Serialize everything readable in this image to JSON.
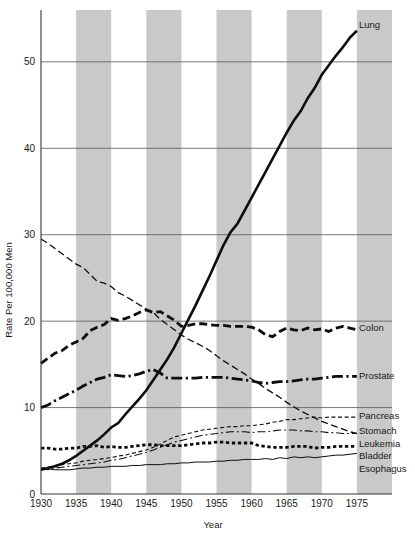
{
  "chart_data": {
    "type": "line",
    "title": "",
    "xlabel": "Year",
    "ylabel": "Rate Per 100,000 Men",
    "xlim": [
      1930,
      1980
    ],
    "ylim": [
      0,
      56
    ],
    "grid": "horizontal-major",
    "legend_position": "right-inline-labels",
    "xticks": [
      1930,
      1935,
      1940,
      1945,
      1950,
      1955,
      1960,
      1965,
      1970,
      1975
    ],
    "xtick_labels": [
      "1930",
      "1935",
      "1940",
      "1945",
      "1950",
      "1955",
      "1960",
      "1965",
      "1970",
      "1975"
    ],
    "yticks": [
      0,
      10,
      20,
      30,
      40,
      50
    ],
    "ytick_labels": [
      "0",
      "10",
      "20",
      "30",
      "40",
      "50"
    ],
    "shaded_bands": [
      {
        "from": 1935,
        "to": 1940
      },
      {
        "from": 1945,
        "to": 1950
      },
      {
        "from": 1955,
        "to": 1960
      },
      {
        "from": 1965,
        "to": 1970
      },
      {
        "from": 1975,
        "to": 1980
      }
    ],
    "band_color": "#c9c9c9",
    "series": [
      {
        "name": "Lung",
        "label": "Lung",
        "style": "solid-thick",
        "x": [
          1930,
          1931,
          1932,
          1933,
          1934,
          1935,
          1936,
          1937,
          1938,
          1939,
          1940,
          1941,
          1942,
          1943,
          1944,
          1945,
          1946,
          1947,
          1948,
          1949,
          1950,
          1951,
          1952,
          1953,
          1954,
          1955,
          1956,
          1957,
          1958,
          1959,
          1960,
          1961,
          1962,
          1963,
          1964,
          1965,
          1966,
          1967,
          1968,
          1969,
          1970,
          1971,
          1972,
          1973,
          1974,
          1975
        ],
        "values": [
          2.8,
          3.0,
          3.2,
          3.5,
          3.9,
          4.4,
          5.0,
          5.6,
          6.2,
          6.9,
          7.7,
          8.2,
          9.2,
          10.1,
          11.0,
          12.0,
          13.2,
          14.4,
          15.6,
          17.0,
          18.6,
          20.2,
          21.8,
          23.5,
          25.2,
          27.0,
          28.8,
          30.3,
          31.3,
          32.8,
          34.3,
          35.8,
          37.3,
          38.8,
          40.3,
          41.8,
          43.2,
          44.3,
          45.8,
          47.0,
          48.5,
          49.6,
          50.7,
          51.7,
          52.8,
          53.6
        ]
      },
      {
        "name": "Colon",
        "label": "Colon",
        "style": "dashed-thick",
        "x": [
          1930,
          1931,
          1932,
          1933,
          1934,
          1935,
          1936,
          1937,
          1938,
          1939,
          1940,
          1941,
          1942,
          1943,
          1944,
          1945,
          1946,
          1947,
          1948,
          1949,
          1950,
          1951,
          1952,
          1953,
          1954,
          1955,
          1956,
          1957,
          1958,
          1959,
          1960,
          1961,
          1962,
          1963,
          1964,
          1965,
          1966,
          1967,
          1968,
          1969,
          1970,
          1971,
          1972,
          1973,
          1974,
          1975
        ],
        "values": [
          15.1,
          15.7,
          16.3,
          16.6,
          17.2,
          17.6,
          18.0,
          18.9,
          19.3,
          19.6,
          20.3,
          20.1,
          20.3,
          20.6,
          21.0,
          21.3,
          21.0,
          21.1,
          20.6,
          20.1,
          19.4,
          19.5,
          19.7,
          19.7,
          19.6,
          19.5,
          19.5,
          19.4,
          19.4,
          19.4,
          19.3,
          19.0,
          18.4,
          18.2,
          18.8,
          19.2,
          19.0,
          18.9,
          19.2,
          19.0,
          19.1,
          18.8,
          19.2,
          19.4,
          19.2,
          19.0
        ]
      },
      {
        "name": "Stomach",
        "label": "Stomach",
        "style": "dashed-thin",
        "x": [
          1930,
          1931,
          1932,
          1933,
          1934,
          1935,
          1936,
          1937,
          1938,
          1939,
          1940,
          1941,
          1942,
          1943,
          1944,
          1945,
          1946,
          1947,
          1948,
          1949,
          1950,
          1951,
          1952,
          1953,
          1954,
          1955,
          1956,
          1957,
          1958,
          1959,
          1960,
          1961,
          1962,
          1963,
          1964,
          1965,
          1966,
          1967,
          1968,
          1969,
          1970,
          1971,
          1972,
          1973,
          1974,
          1975
        ],
        "values": [
          29.5,
          29.0,
          28.4,
          27.8,
          27.2,
          26.6,
          26.2,
          25.4,
          24.6,
          24.4,
          24.0,
          23.3,
          22.9,
          22.4,
          21.9,
          21.4,
          21.0,
          20.2,
          19.6,
          19.0,
          18.4,
          17.9,
          17.5,
          17.1,
          16.6,
          16.0,
          15.4,
          14.9,
          14.4,
          13.9,
          13.3,
          12.8,
          12.2,
          11.7,
          11.2,
          10.6,
          10.1,
          9.6,
          9.2,
          8.8,
          8.4,
          8.1,
          7.8,
          7.5,
          7.2,
          7.0
        ]
      },
      {
        "name": "Prostate",
        "label": "Prostate",
        "style": "dashdot-thick",
        "x": [
          1930,
          1931,
          1932,
          1933,
          1934,
          1935,
          1936,
          1937,
          1938,
          1939,
          1940,
          1941,
          1942,
          1943,
          1944,
          1945,
          1946,
          1947,
          1948,
          1949,
          1950,
          1951,
          1952,
          1953,
          1954,
          1955,
          1956,
          1957,
          1958,
          1959,
          1960,
          1961,
          1962,
          1963,
          1964,
          1965,
          1966,
          1967,
          1968,
          1969,
          1970,
          1971,
          1972,
          1973,
          1974,
          1975
        ],
        "values": [
          10.0,
          10.3,
          10.8,
          11.2,
          11.6,
          12.0,
          12.5,
          12.9,
          13.3,
          13.5,
          13.8,
          13.7,
          13.6,
          13.7,
          13.9,
          14.2,
          14.4,
          14.0,
          13.4,
          13.4,
          13.4,
          13.4,
          13.4,
          13.5,
          13.5,
          13.5,
          13.5,
          13.4,
          13.3,
          13.2,
          13.1,
          12.9,
          12.8,
          12.9,
          13.0,
          13.0,
          13.1,
          13.2,
          13.3,
          13.3,
          13.4,
          13.5,
          13.6,
          13.6,
          13.6,
          13.6
        ]
      },
      {
        "name": "Pancreas",
        "label": "Pancreas",
        "style": "dashed-fine",
        "x": [
          1930,
          1931,
          1932,
          1933,
          1934,
          1935,
          1936,
          1937,
          1938,
          1939,
          1940,
          1941,
          1942,
          1943,
          1944,
          1945,
          1946,
          1947,
          1948,
          1949,
          1950,
          1951,
          1952,
          1953,
          1954,
          1955,
          1956,
          1957,
          1958,
          1959,
          1960,
          1961,
          1962,
          1963,
          1964,
          1965,
          1966,
          1967,
          1968,
          1969,
          1970,
          1971,
          1972,
          1973,
          1974,
          1975
        ],
        "values": [
          3.0,
          3.1,
          3.3,
          3.4,
          3.5,
          3.6,
          3.8,
          3.9,
          4.0,
          4.1,
          4.2,
          4.4,
          4.5,
          4.7,
          4.9,
          5.1,
          5.4,
          5.8,
          6.2,
          6.6,
          6.8,
          7.0,
          7.2,
          7.4,
          7.5,
          7.6,
          7.7,
          7.8,
          7.8,
          7.9,
          7.9,
          8.0,
          8.1,
          8.3,
          8.4,
          8.6,
          8.6,
          8.7,
          8.8,
          8.9,
          8.8,
          8.9,
          8.9,
          8.9,
          8.9,
          8.9
        ]
      },
      {
        "name": "Leukemia",
        "label": "Leukemia",
        "style": "dashdot-thin",
        "x": [
          1930,
          1931,
          1932,
          1933,
          1934,
          1935,
          1936,
          1937,
          1938,
          1939,
          1940,
          1941,
          1942,
          1943,
          1944,
          1945,
          1946,
          1947,
          1948,
          1949,
          1950,
          1951,
          1952,
          1953,
          1954,
          1955,
          1956,
          1957,
          1958,
          1959,
          1960,
          1961,
          1962,
          1963,
          1964,
          1965,
          1966,
          1967,
          1968,
          1969,
          1970,
          1971,
          1972,
          1973,
          1974,
          1975
        ],
        "values": [
          2.9,
          2.8,
          3.0,
          3.1,
          3.2,
          3.3,
          3.4,
          3.5,
          3.6,
          3.7,
          3.9,
          4.0,
          4.2,
          4.4,
          4.6,
          4.8,
          5.1,
          5.4,
          5.7,
          6.0,
          6.2,
          6.4,
          6.6,
          6.8,
          6.9,
          7.0,
          7.1,
          7.2,
          7.2,
          7.2,
          7.1,
          7.2,
          7.2,
          7.3,
          7.4,
          7.4,
          7.4,
          7.3,
          7.3,
          7.2,
          7.2,
          7.1,
          7.1,
          7.0,
          7.0,
          7.0
        ]
      },
      {
        "name": "Bladder",
        "label": "Bladder",
        "style": "dotted-thick",
        "x": [
          1930,
          1931,
          1932,
          1933,
          1934,
          1935,
          1936,
          1937,
          1938,
          1939,
          1940,
          1941,
          1942,
          1943,
          1944,
          1945,
          1946,
          1947,
          1948,
          1949,
          1950,
          1951,
          1952,
          1953,
          1954,
          1955,
          1956,
          1957,
          1958,
          1959,
          1960,
          1961,
          1962,
          1963,
          1964,
          1965,
          1966,
          1967,
          1968,
          1969,
          1970,
          1971,
          1972,
          1973,
          1974,
          1975
        ],
        "values": [
          5.3,
          5.3,
          5.2,
          5.2,
          5.3,
          5.3,
          5.5,
          5.5,
          5.6,
          5.4,
          5.5,
          5.4,
          5.4,
          5.5,
          5.6,
          5.7,
          5.7,
          5.6,
          5.6,
          5.6,
          5.6,
          5.7,
          5.8,
          5.9,
          5.9,
          6.0,
          6.0,
          5.9,
          5.9,
          5.9,
          5.9,
          5.6,
          5.5,
          5.4,
          5.4,
          5.4,
          5.5,
          5.5,
          5.5,
          5.3,
          5.4,
          5.4,
          5.5,
          5.5,
          5.5,
          5.5
        ]
      },
      {
        "name": "Esophagus",
        "label": "Esophagus",
        "style": "solid-thin",
        "x": [
          1930,
          1931,
          1932,
          1933,
          1934,
          1935,
          1936,
          1937,
          1938,
          1939,
          1940,
          1941,
          1942,
          1943,
          1944,
          1945,
          1946,
          1947,
          1948,
          1949,
          1950,
          1951,
          1952,
          1953,
          1954,
          1955,
          1956,
          1957,
          1958,
          1959,
          1960,
          1961,
          1962,
          1963,
          1964,
          1965,
          1966,
          1967,
          1968,
          1969,
          1970,
          1971,
          1972,
          1973,
          1974,
          1975
        ],
        "values": [
          2.9,
          2.9,
          2.8,
          2.8,
          2.8,
          2.9,
          3.0,
          3.0,
          3.1,
          3.1,
          3.2,
          3.2,
          3.2,
          3.3,
          3.3,
          3.4,
          3.4,
          3.4,
          3.5,
          3.5,
          3.6,
          3.6,
          3.7,
          3.7,
          3.7,
          3.8,
          3.8,
          3.9,
          3.9,
          4.0,
          4.0,
          4.0,
          4.1,
          4.0,
          4.2,
          4.1,
          4.3,
          4.2,
          4.3,
          4.2,
          4.3,
          4.4,
          4.5,
          4.5,
          4.6,
          4.7
        ]
      }
    ]
  },
  "labels": {
    "lung": "Lung",
    "colon": "Colon",
    "prostate": "Prostate",
    "pancreas": "Pancreas",
    "stomach": "Stomach",
    "leukemia": "Leukemia",
    "bladder": "Bladder",
    "esophagus": "Esophagus"
  },
  "axis": {
    "x_title": "Year",
    "y_title": "Rate Per 100,000 Men"
  },
  "caption": {
    "partial_text": ""
  }
}
